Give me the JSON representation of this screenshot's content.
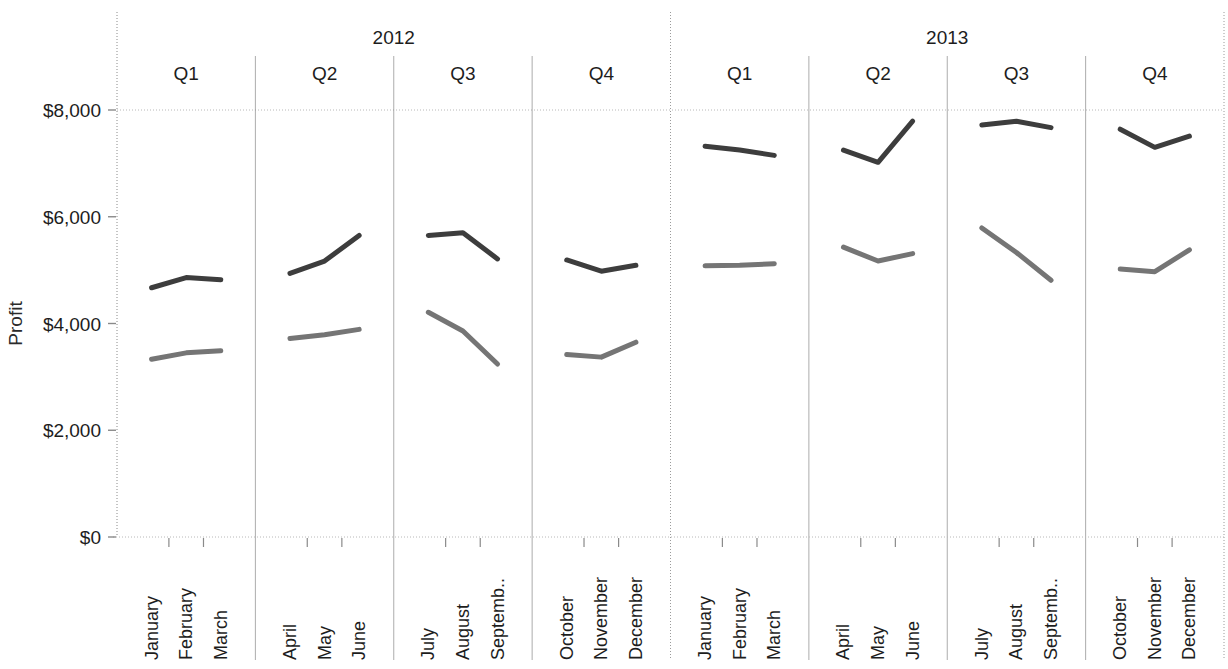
{
  "chart_data": {
    "type": "line",
    "title": "",
    "xlabel": "",
    "ylabel": "Profit",
    "ylim": [
      0,
      8000
    ],
    "yticks": [
      0,
      2000,
      4000,
      6000,
      8000
    ],
    "ytick_labels": [
      "$0",
      "$2,000",
      "$4,000",
      "$6,000",
      "$8,000"
    ],
    "grid": "horizontal-top-only",
    "legend_position": "none",
    "panel_levels": [
      {
        "name": "year",
        "labels": [
          "2012",
          "2013"
        ]
      },
      {
        "name": "quarter",
        "labels": [
          "Q1",
          "Q2",
          "Q3",
          "Q4",
          "Q1",
          "Q2",
          "Q3",
          "Q4"
        ]
      }
    ],
    "categories": [
      "January",
      "February",
      "March",
      "April",
      "May",
      "June",
      "July",
      "August",
      "Septemb..",
      "October",
      "November",
      "December",
      "January",
      "February",
      "March",
      "April",
      "May",
      "June",
      "July",
      "August",
      "Septemb..",
      "October",
      "November",
      "December"
    ],
    "panels": [
      {
        "year": "2012",
        "quarter": "Q1",
        "months": [
          "January",
          "February",
          "March"
        ]
      },
      {
        "year": "2012",
        "quarter": "Q2",
        "months": [
          "April",
          "May",
          "June"
        ]
      },
      {
        "year": "2012",
        "quarter": "Q3",
        "months": [
          "July",
          "August",
          "Septemb.."
        ]
      },
      {
        "year": "2012",
        "quarter": "Q4",
        "months": [
          "October",
          "November",
          "December"
        ]
      },
      {
        "year": "2013",
        "quarter": "Q1",
        "months": [
          "January",
          "February",
          "March"
        ]
      },
      {
        "year": "2013",
        "quarter": "Q2",
        "months": [
          "April",
          "May",
          "June"
        ]
      },
      {
        "year": "2013",
        "quarter": "Q3",
        "months": [
          "July",
          "August",
          "Septemb.."
        ]
      },
      {
        "year": "2013",
        "quarter": "Q4",
        "months": [
          "October",
          "November",
          "December"
        ]
      }
    ],
    "series": [
      {
        "name": "series-upper",
        "color": "#3d3d3d",
        "values": [
          4670,
          4860,
          4820,
          4940,
          5170,
          5650,
          5650,
          5700,
          5210,
          5190,
          4980,
          5090,
          7320,
          7250,
          7150,
          7250,
          7020,
          7790,
          7720,
          7790,
          7670,
          7640,
          7300,
          7510
        ]
      },
      {
        "name": "series-lower",
        "color": "#757575",
        "values": [
          3330,
          3450,
          3490,
          3720,
          3790,
          3890,
          4210,
          3860,
          3240,
          3420,
          3370,
          3650,
          5080,
          5090,
          5120,
          5430,
          5170,
          5310,
          5790,
          5330,
          4810,
          5020,
          4970,
          5380
        ]
      }
    ]
  },
  "axis": {
    "y_title": "Profit"
  },
  "colors": {
    "series_upper": "#3d3d3d",
    "series_lower": "#757575",
    "axis_line": "#8a8a8a",
    "grid_line": "#b8b8b8",
    "panel_divider": "#8a8a8a",
    "text": "#1d1d1d"
  }
}
